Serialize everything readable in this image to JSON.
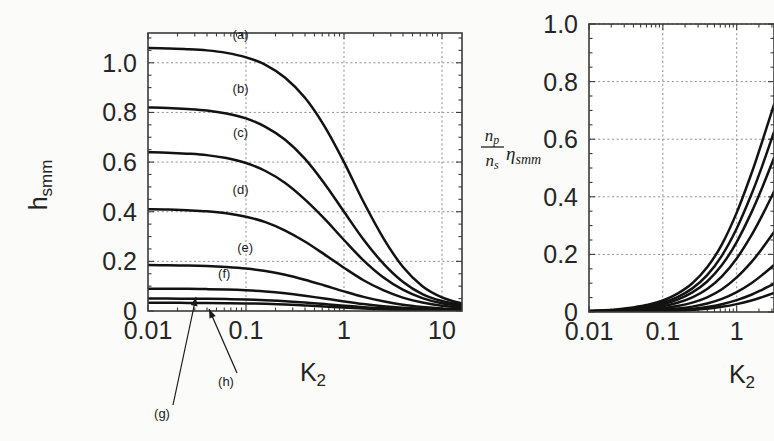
{
  "figure": {
    "background": "#fbfbf9",
    "ink": "#121212",
    "grid_color": "#8d8d8d"
  },
  "chart_data": [
    {
      "id": "left-panel",
      "type": "line",
      "title": "",
      "xlabel": "K",
      "xlabel_sub": "2",
      "ylabel": "h",
      "ylabel_sub": "smm",
      "xscale": "log",
      "xlim": [
        0.01,
        16
      ],
      "ylim": [
        0,
        1.12
      ],
      "xticks": [
        0.01,
        0.1,
        1,
        10
      ],
      "xticklabels": [
        "0.01",
        "0.1",
        "1",
        "10"
      ],
      "yticks": [
        0,
        0.2,
        0.4,
        0.6,
        0.8,
        1.0
      ],
      "yticklabels": [
        "0",
        "0.2",
        "0.4",
        "0.6",
        "0.8",
        "1.0"
      ],
      "grid": true,
      "legend": "inline-curve-labels",
      "series": [
        {
          "name": "(a)",
          "plateau": 1.06,
          "knee": 0.3,
          "label_x": 0.088,
          "label_y": 1.095,
          "width": 2.6,
          "x": [
            0.01,
            0.0158,
            0.0251,
            0.0398,
            0.0631,
            0.1,
            0.158,
            0.251,
            0.398,
            0.631,
            1.0,
            1.58,
            2.51,
            3.98,
            6.31,
            10.0,
            16.0
          ],
          "y": [
            1.06,
            1.058,
            1.055,
            1.05,
            1.04,
            1.022,
            0.992,
            0.94,
            0.86,
            0.745,
            0.6,
            0.44,
            0.295,
            0.178,
            0.1,
            0.055,
            0.03
          ]
        },
        {
          "name": "(b)",
          "plateau": 0.82,
          "knee": 0.26,
          "label_x": 0.088,
          "label_y": 0.878,
          "width": 2.6,
          "x": [
            0.01,
            0.0158,
            0.0251,
            0.0398,
            0.0631,
            0.1,
            0.158,
            0.251,
            0.398,
            0.631,
            1.0,
            1.58,
            2.51,
            3.98,
            6.31,
            10.0,
            16.0
          ],
          "y": [
            0.82,
            0.818,
            0.814,
            0.808,
            0.796,
            0.776,
            0.742,
            0.69,
            0.614,
            0.514,
            0.4,
            0.288,
            0.192,
            0.118,
            0.068,
            0.04,
            0.024
          ]
        },
        {
          "name": "(c)",
          "plateau": 0.64,
          "knee": 0.24,
          "label_x": 0.088,
          "label_y": 0.7,
          "width": 2.6,
          "x": [
            0.01,
            0.0158,
            0.0251,
            0.0398,
            0.0631,
            0.1,
            0.158,
            0.251,
            0.398,
            0.631,
            1.0,
            1.58,
            2.51,
            3.98,
            6.31,
            10.0,
            16.0
          ],
          "y": [
            0.64,
            0.638,
            0.634,
            0.628,
            0.616,
            0.596,
            0.564,
            0.516,
            0.45,
            0.372,
            0.286,
            0.204,
            0.136,
            0.086,
            0.052,
            0.031,
            0.02
          ]
        },
        {
          "name": "(d)",
          "plateau": 0.41,
          "knee": 0.22,
          "label_x": 0.088,
          "label_y": 0.47,
          "width": 2.6,
          "x": [
            0.01,
            0.0158,
            0.0251,
            0.0398,
            0.0631,
            0.1,
            0.158,
            0.251,
            0.398,
            0.631,
            1.0,
            1.58,
            2.51,
            3.98,
            6.31,
            10.0,
            16.0
          ],
          "y": [
            0.41,
            0.409,
            0.406,
            0.402,
            0.394,
            0.38,
            0.358,
            0.324,
            0.28,
            0.228,
            0.174,
            0.124,
            0.084,
            0.054,
            0.034,
            0.021,
            0.014
          ]
        },
        {
          "name": "(e)",
          "plateau": 0.185,
          "knee": 0.2,
          "label_x": 0.098,
          "label_y": 0.238,
          "width": 2.4,
          "x": [
            0.01,
            0.0158,
            0.0251,
            0.0398,
            0.0631,
            0.1,
            0.158,
            0.251,
            0.398,
            0.631,
            1.0,
            1.58,
            2.51,
            3.98,
            6.31,
            10.0,
            16.0
          ],
          "y": [
            0.185,
            0.184,
            0.183,
            0.181,
            0.177,
            0.171,
            0.161,
            0.146,
            0.126,
            0.103,
            0.079,
            0.057,
            0.039,
            0.025,
            0.016,
            0.01,
            0.007
          ]
        },
        {
          "name": "(f)",
          "plateau": 0.09,
          "knee": 0.2,
          "label_x": 0.06,
          "label_y": 0.132,
          "width": 2.2,
          "x": [
            0.01,
            0.0158,
            0.0251,
            0.0398,
            0.0631,
            0.1,
            0.158,
            0.251,
            0.398,
            0.631,
            1.0,
            1.58,
            2.51,
            3.98,
            6.31,
            10.0,
            16.0
          ],
          "y": [
            0.09,
            0.0898,
            0.0892,
            0.0882,
            0.0864,
            0.0834,
            0.0786,
            0.0712,
            0.0614,
            0.0502,
            0.0386,
            0.028,
            0.0192,
            0.0126,
            0.008,
            0.005,
            0.0034
          ]
        },
        {
          "name": "(g)",
          "plateau": 0.05,
          "knee": 0.2,
          "label_x": 0.0,
          "label_y": 0.0,
          "width": 2.1,
          "x": [
            0.01,
            0.0158,
            0.0251,
            0.0398,
            0.0631,
            0.1,
            0.158,
            0.251,
            0.398,
            0.631,
            1.0,
            1.58,
            2.51,
            3.98,
            6.31,
            10.0,
            16.0
          ],
          "y": [
            0.05,
            0.0499,
            0.0496,
            0.049,
            0.048,
            0.0464,
            0.0437,
            0.0396,
            0.0342,
            0.028,
            0.0215,
            0.0156,
            0.0107,
            0.007,
            0.0045,
            0.0028,
            0.0019
          ]
        },
        {
          "name": "(h)",
          "plateau": 0.033,
          "knee": 0.2,
          "label_x": 0.0,
          "label_y": 0.0,
          "width": 2.1,
          "x": [
            0.01,
            0.0158,
            0.0251,
            0.0398,
            0.0631,
            0.1,
            0.158,
            0.251,
            0.398,
            0.631,
            1.0,
            1.58,
            2.51,
            3.98,
            6.31,
            10.0,
            16.0
          ],
          "y": [
            0.033,
            0.0329,
            0.0327,
            0.0324,
            0.0317,
            0.0307,
            0.0289,
            0.0262,
            0.0226,
            0.0185,
            0.0142,
            0.0103,
            0.0071,
            0.0046,
            0.003,
            0.0019,
            0.0013
          ]
        }
      ],
      "annotations": [
        {
          "text": "(g)",
          "text_x": 162,
          "text_y": 418,
          "tip_x": 196,
          "tip_y": 297
        },
        {
          "text": "(h)",
          "text_x": 226,
          "text_y": 386,
          "tip_x": 209,
          "tip_y": 309
        }
      ]
    },
    {
      "id": "right-panel",
      "type": "line",
      "title": "",
      "xlabel": "K",
      "xlabel_sub": "2",
      "ylabel_numer": "n",
      "ylabel_numer_sub": "p",
      "ylabel_denom": "n",
      "ylabel_denom_sub": "s",
      "ylabel_eta": "η",
      "ylabel_eta_sub": "smm",
      "xscale": "log",
      "xlim": [
        0.01,
        3.2
      ],
      "ylim": [
        0,
        1.0
      ],
      "xticks": [
        0.01,
        0.1,
        1
      ],
      "xticklabels": [
        "0.01",
        "0.1",
        "1"
      ],
      "yticks": [
        0,
        0.2,
        0.4,
        0.6,
        0.8,
        1.0
      ],
      "yticklabels": [
        "0",
        "0.2",
        "0.4",
        "0.6",
        "0.8",
        "1.0"
      ],
      "grid": true,
      "clipped_right": true,
      "series": [
        {
          "name": "(a)",
          "width": 2.6,
          "x": [
            0.01,
            0.0158,
            0.0251,
            0.0398,
            0.0631,
            0.1,
            0.158,
            0.251,
            0.398,
            0.631,
            1.0,
            1.58,
            2.2,
            3.2
          ],
          "y": [
            0.004,
            0.006,
            0.01,
            0.016,
            0.025,
            0.04,
            0.064,
            0.1,
            0.155,
            0.235,
            0.345,
            0.48,
            0.59,
            0.72
          ]
        },
        {
          "name": "(b)",
          "width": 2.6,
          "x": [
            0.01,
            0.0158,
            0.0251,
            0.0398,
            0.0631,
            0.1,
            0.158,
            0.251,
            0.398,
            0.631,
            1.0,
            1.58,
            2.2,
            3.2
          ],
          "y": [
            0.003,
            0.005,
            0.008,
            0.013,
            0.021,
            0.033,
            0.052,
            0.082,
            0.128,
            0.196,
            0.29,
            0.408,
            0.505,
            0.625
          ]
        },
        {
          "name": "(c)",
          "width": 2.6,
          "x": [
            0.01,
            0.0158,
            0.0251,
            0.0398,
            0.0631,
            0.1,
            0.158,
            0.251,
            0.398,
            0.631,
            1.0,
            1.58,
            2.2,
            3.2
          ],
          "y": [
            0.0025,
            0.004,
            0.0065,
            0.0105,
            0.017,
            0.027,
            0.043,
            0.068,
            0.106,
            0.163,
            0.243,
            0.345,
            0.43,
            0.535
          ]
        },
        {
          "name": "(d)",
          "width": 2.6,
          "x": [
            0.01,
            0.0158,
            0.0251,
            0.0398,
            0.0631,
            0.1,
            0.158,
            0.251,
            0.398,
            0.631,
            1.0,
            1.58,
            2.2,
            3.2
          ],
          "y": [
            0.002,
            0.003,
            0.005,
            0.008,
            0.0128,
            0.02,
            0.032,
            0.051,
            0.08,
            0.124,
            0.186,
            0.266,
            0.334,
            0.418
          ]
        },
        {
          "name": "(e)",
          "width": 2.4,
          "x": [
            0.01,
            0.0158,
            0.0251,
            0.0398,
            0.0631,
            0.1,
            0.158,
            0.251,
            0.398,
            0.631,
            1.0,
            1.58,
            2.2,
            3.2
          ],
          "y": [
            0.0012,
            0.002,
            0.003,
            0.005,
            0.008,
            0.0128,
            0.0205,
            0.0325,
            0.051,
            0.079,
            0.12,
            0.173,
            0.22,
            0.278
          ]
        },
        {
          "name": "(f)",
          "width": 2.2,
          "x": [
            0.01,
            0.0158,
            0.0251,
            0.0398,
            0.0631,
            0.1,
            0.158,
            0.251,
            0.398,
            0.631,
            1.0,
            1.58,
            2.2,
            3.2
          ],
          "y": [
            0.0007,
            0.0011,
            0.0018,
            0.0029,
            0.0046,
            0.0074,
            0.0118,
            0.0187,
            0.0293,
            0.0455,
            0.069,
            0.1,
            0.128,
            0.163
          ]
        },
        {
          "name": "(g)",
          "width": 2.1,
          "x": [
            0.01,
            0.0158,
            0.0251,
            0.0398,
            0.0631,
            0.1,
            0.158,
            0.251,
            0.398,
            0.631,
            1.0,
            1.58,
            2.2,
            3.2
          ],
          "y": [
            0.0004,
            0.0007,
            0.0011,
            0.0017,
            0.0028,
            0.0044,
            0.007,
            0.0111,
            0.0175,
            0.0272,
            0.0414,
            0.06,
            0.077,
            0.098
          ]
        },
        {
          "name": "(h)",
          "width": 2.1,
          "x": [
            0.01,
            0.0158,
            0.0251,
            0.0398,
            0.0631,
            0.1,
            0.158,
            0.251,
            0.398,
            0.631,
            1.0,
            1.58,
            2.2,
            3.2
          ],
          "y": [
            0.0002,
            0.0004,
            0.0007,
            0.0011,
            0.0018,
            0.0029,
            0.0046,
            0.0073,
            0.0115,
            0.018,
            0.0274,
            0.04,
            0.0515,
            0.066
          ]
        }
      ]
    }
  ]
}
